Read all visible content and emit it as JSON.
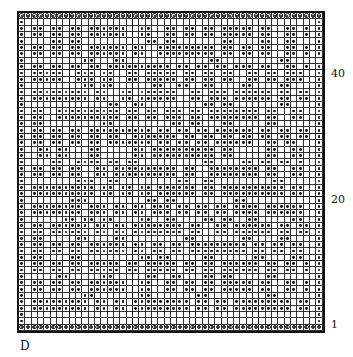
{
  "figure": {
    "plate_label": "D",
    "rows": 50,
    "cols": 48,
    "thick_col_lines_after": [
      8,
      18,
      28,
      38
    ],
    "thick_row_lines_after": [
      9,
      19,
      29,
      39
    ],
    "row_labels": [
      {
        "text": "40",
        "y": 68
      },
      {
        "text": "20",
        "y": 194
      },
      {
        "text": "1",
        "y": 319
      }
    ],
    "legend": {
      "c": "ringed-dot",
      "o": "dot",
      ".": "empty"
    },
    "grid": [
      "cccccccccccccccccccccccccccccccccccccccccccccccc",
      "o..............................................o",
      "o.oo.oo.oo.oooooo..oo..oo.oo.oo.ooooo.oo..oo.o.o",
      "o.oo.oo.oo.oooooo..oo..oo.oo.oo.ooooo.oo..oo.o.o",
      "o....oo.oo..........oo.oo.......oo....oo..oo...o",
      "o.oo.oo.oo.oooooo.oo..ooooooooo.oo.oo.oo..oo.o.o",
      "o.oo.oo.oo.oooooo.oo..ooooooooo.oo.oo.oo..oo.o.o",
      "o.........oo...oo.............oo.........oo.....o",
      "o.oo.oo.oo.oo.oooooooooo.oo.oo.oo.ooo.oo..oo.o.o",
      "o.ooooo..ooo.oo..oo.ooooo.oo.oo.oo..oo.oo.ooo..o",
      "o.ooooo..ooo.oo..oo.ooooo.oo.oo.oo..oo.oo.ooo..o",
      "o.........oo.oo......oo..oo..oo....oo....oo....o",
      "o.ooooooooo.oo..oo.oooooo..oo.ooo.oooooo.oo.oo.o",
      "o.ooooooooo.oo..oo.oooooo..oo.ooo.oooooo.oo.oo.o",
      "o.............oo..oo.........oo.oo.......oo....o",
      "o.oo..oooooooooo.oo.oo.ooo.oo.oooooooo.oo..oo..o",
      "o.oo..oooooooooo.oo.oo.ooo.oo.oooooooo.oo..oo..o",
      "o.oo.........oo.........oo.oo...oo.....oo......o",
      "o.oo.oo.oo.oooooooooo.oo.oo.oo.oooooo.oo.oo.oo.o",
      "o.oo.oo.oo.oo.oo..ooooooo.oo.oo.oo.oo.oo.oo.oo.o",
      "o.oo.oo.oo.oo.ooooooo.oo.oo.oo.oooooo..oo.oo...o",
      "o..oo.oo...oo.....oo.oooooooooo.oo.....oo..oo..o",
      "o..oo.oo...oo.....oo.oooooooooo.oo.....oo..oo..o",
      "o....oo..oooo.oo.oo..........oo....oo.oo.oo.o..o",
      "o.oo.oo.oo..oo.oooooooooo.oo..oooooooo.oo..oo..o",
      "o.oo.oo.oo..oo.oooooooooo.oo..oooooooo.oo..oo..o",
      "o........ooo..oo.........oo..oo.........oo.....o",
      "o.oooooooooo.oo.oo.oo.oooooo.oo.oooooooooo.oo..o",
      "o.oooooooooo.oo.oo.oo.oooooo.oo.oooooooooo.oo..o",
      "o.......ooo.........oo.oo.........oo...........o",
      "o.oooooooo.ooo.oo.oo.ooo.oo.oo.oo.oooo.oooooo..o",
      "o.oooooooo.ooo.oo.oo.ooo.oo.oo.oo.oooo.oooooo..o",
      "o......oo.oo.oo....oo..oo....oo.oo..oo.....oo..o",
      "o.oo.oooooo.oo.oo.oooooooo.oo..oo.oooooo.oo.oo.o",
      "o.oo.oooooo.oo.oo.oooooooo.oo..oo.oooooo.oo.oo.o",
      "o.oo.....oo....oo.........oo.......oo....oo....o",
      "o.oo.oo.oo.oooooo.oo.oo.oo.ooooooooo.oo.oo.oo..o",
      "o.oo.oo.oo.oooooo.oo.oo.oo.ooooooooo.oo.oo.oo..o",
      "o.oo....oo.........oo.oo.....oo......oo....oo..o",
      "o.oo.oo.oo.ooooo.oo.ooooo.oo.oo.oooooo.oo.oo.o.o",
      "o.oo.oo.oo.ooooo.oo.ooooo.oo.oo.oooooo.oo.oo.o.o",
      "o.....oo.....oo.....oo..oo...oo.oo.....oo......o",
      "o.oo.oo.oo.oooooo..oo..oo.oo.oo.ooooo.oo..oo.o.o",
      "o.oo.oo.oo.oooooo..oo..oo.oo.oo.ooooo.oo..oo.o.o",
      "o.........oo.......oo.......oo.........oo......o",
      "o.ooooooooo.oo.oo.ooooooooo.oo.oo.ooooooooo.oo.o",
      "o.ooooooooo.oo.oo.ooooooooo.oo.oo.ooooooooo.oo.o",
      "o..............................................o",
      "o..............................................o",
      "cccccccccccccccccccccccccccccccccccccccccccccccc"
    ]
  }
}
